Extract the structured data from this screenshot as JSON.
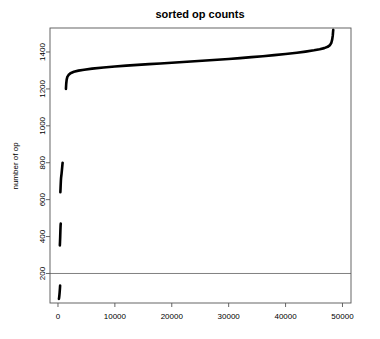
{
  "chart_data": {
    "type": "line",
    "title": "sorted op counts",
    "xlabel": "",
    "ylabel": "number of op",
    "xlim": [
      -1400,
      51500
    ],
    "ylim": [
      40,
      1530
    ],
    "grid": false,
    "legend": null,
    "xticks": [
      0,
      10000,
      20000,
      30000,
      40000,
      50000
    ],
    "xtick_labels": [
      "0",
      "10000",
      "20000",
      "30000",
      "40000",
      "50000"
    ],
    "yticks": [
      200,
      400,
      600,
      800,
      1000,
      1200,
      1400
    ],
    "ytick_labels": [
      "200",
      "400",
      "600",
      "800",
      "1000",
      "1200",
      "1400"
    ],
    "annotations": [
      {
        "type": "hline",
        "y": 200,
        "color": "#808080",
        "label": "reference line at 200"
      }
    ],
    "series": [
      {
        "name": "segment-1-lowest",
        "color": "#000000",
        "points": [
          [
            170,
            62
          ],
          [
            215,
            72
          ],
          [
            255,
            84
          ],
          [
            290,
            96
          ],
          [
            320,
            108
          ],
          [
            345,
            118
          ],
          [
            365,
            128
          ],
          [
            380,
            134
          ]
        ]
      },
      {
        "name": "segment-2-low",
        "color": "#000000",
        "points": [
          [
            330,
            352
          ],
          [
            360,
            372
          ],
          [
            385,
            392
          ],
          [
            405,
            412
          ],
          [
            425,
            430
          ],
          [
            445,
            448
          ],
          [
            465,
            462
          ],
          [
            490,
            470
          ]
        ]
      },
      {
        "name": "segment-3-mid",
        "color": "#000000",
        "points": [
          [
            420,
            640
          ],
          [
            450,
            660
          ],
          [
            480,
            682
          ],
          [
            510,
            702
          ],
          [
            545,
            718
          ],
          [
            585,
            728
          ],
          [
            630,
            740
          ],
          [
            680,
            756
          ],
          [
            730,
            772
          ],
          [
            780,
            788
          ],
          [
            820,
            800
          ]
        ]
      },
      {
        "name": "segment-4-main",
        "color": "#000000",
        "points": [
          [
            1400,
            1200
          ],
          [
            1450,
            1228
          ],
          [
            1530,
            1250
          ],
          [
            1650,
            1265
          ],
          [
            1850,
            1275
          ],
          [
            2200,
            1285
          ],
          [
            2800,
            1293
          ],
          [
            3600,
            1299
          ],
          [
            4600,
            1304
          ],
          [
            6000,
            1310
          ],
          [
            8000,
            1316
          ],
          [
            10000,
            1321
          ],
          [
            12000,
            1326
          ],
          [
            14000,
            1330
          ],
          [
            16000,
            1334
          ],
          [
            18000,
            1338
          ],
          [
            20000,
            1342
          ],
          [
            22000,
            1346
          ],
          [
            24000,
            1350
          ],
          [
            26000,
            1354
          ],
          [
            28000,
            1358
          ],
          [
            30000,
            1362
          ],
          [
            32000,
            1367
          ],
          [
            34000,
            1372
          ],
          [
            36000,
            1377
          ],
          [
            38000,
            1383
          ],
          [
            40000,
            1389
          ],
          [
            42000,
            1396
          ],
          [
            43500,
            1402
          ],
          [
            45000,
            1409
          ],
          [
            46000,
            1415
          ],
          [
            46800,
            1421
          ],
          [
            47400,
            1428
          ],
          [
            47800,
            1437
          ],
          [
            48050,
            1450
          ],
          [
            48200,
            1468
          ],
          [
            48300,
            1490
          ],
          [
            48350,
            1510
          ],
          [
            48380,
            1520
          ]
        ]
      }
    ]
  },
  "axes": {
    "title_text": "sorted op counts",
    "ylabel_text": "number of op"
  }
}
